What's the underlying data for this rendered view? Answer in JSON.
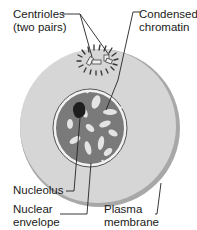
{
  "diagram": {
    "type": "cell-interphase-illustration",
    "labels": {
      "centrioles": "Centrioles\n(two pairs)",
      "chromatin": "Condensed\nchromatin",
      "nucleolus": "Nucleolus",
      "nuclear_envelope": "Nuclear\nenvelope",
      "plasma_membrane": "Plasma\nmembrane"
    },
    "colors": {
      "cytoplasm": "#d6d6d6",
      "membrane_edge": "#9a9a9a",
      "nucleus_dark": "#6e6e6e",
      "nucleus_light": "#e8e8e8",
      "nucleolus": "#222222",
      "leader_line": "#222222"
    }
  }
}
